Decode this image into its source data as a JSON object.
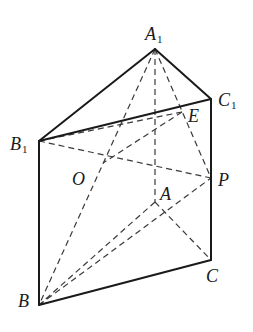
{
  "diagram": {
    "type": "triangular prism (geometry figure)",
    "points": {
      "A1": {
        "label": "A",
        "sub": "1",
        "x": 155,
        "y": 49,
        "lx": 145,
        "ly": 40
      },
      "B1": {
        "label": "B",
        "sub": "1",
        "x": 39,
        "y": 141,
        "lx": 10,
        "ly": 150
      },
      "C1": {
        "label": "C",
        "sub": "1",
        "x": 211,
        "y": 99,
        "lx": 218,
        "ly": 106
      },
      "A": {
        "label": "A",
        "sub": "",
        "x": 155,
        "y": 202,
        "lx": 160,
        "ly": 200
      },
      "B": {
        "label": "B",
        "sub": "",
        "x": 39,
        "y": 305,
        "lx": 18,
        "ly": 307
      },
      "C": {
        "label": "C",
        "sub": "",
        "x": 211,
        "y": 260,
        "lx": 206,
        "ly": 282
      },
      "E": {
        "label": "E",
        "sub": "",
        "x": 182,
        "y": 112,
        "lx": 188,
        "ly": 122
      },
      "P": {
        "label": "P",
        "sub": "",
        "x": 211,
        "y": 178,
        "lx": 218,
        "ly": 186
      },
      "O": {
        "label": "O",
        "sub": "",
        "x": 103,
        "y": 163,
        "lx": 72,
        "ly": 185
      }
    },
    "solid_edges": [
      [
        "A1",
        "B1"
      ],
      [
        "A1",
        "C1"
      ],
      [
        "B1",
        "C1"
      ],
      [
        "B1",
        "B"
      ],
      [
        "C1",
        "C"
      ],
      [
        "B",
        "C"
      ]
    ],
    "dashed_edges": [
      [
        "A1",
        "A"
      ],
      [
        "A",
        "B"
      ],
      [
        "A",
        "C"
      ],
      [
        "A1",
        "B"
      ],
      [
        "A1",
        "P"
      ],
      [
        "B1",
        "E"
      ],
      [
        "B1",
        "P"
      ],
      [
        "E",
        "O"
      ],
      [
        "B",
        "P"
      ]
    ]
  }
}
